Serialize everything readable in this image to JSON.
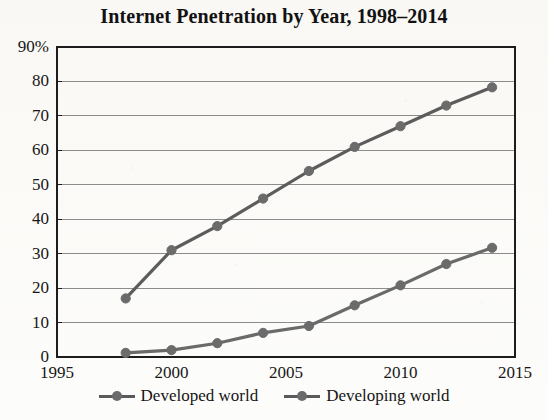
{
  "chart_data": {
    "type": "line",
    "title": "Internet Penetration by Year, 1998–2014",
    "xlabel": "",
    "ylabel": "",
    "xlim": [
      1995,
      2015
    ],
    "ylim": [
      0,
      90
    ],
    "x_ticks": [
      1995,
      2000,
      2005,
      2010,
      2015
    ],
    "x_tick_labels": [
      "1995",
      "2000",
      "2005",
      "2010",
      "2015"
    ],
    "y_ticks": [
      0,
      10,
      20,
      30,
      40,
      50,
      60,
      70,
      80,
      90
    ],
    "y_tick_labels": [
      "0",
      "10",
      "20",
      "30",
      "40",
      "50",
      "60",
      "70",
      "80",
      "90%"
    ],
    "grid": "horizontal",
    "legend_position": "bottom",
    "x": [
      1998,
      2000,
      2002,
      2004,
      2006,
      2008,
      2010,
      2012,
      2014
    ],
    "series": [
      {
        "name": "Developed world",
        "color": "#5c5c5c",
        "marker": "circle",
        "values": [
          17,
          31,
          38,
          46,
          54,
          61,
          67,
          73,
          78.3
        ]
      },
      {
        "name": "Developing world",
        "color": "#6a6a6a",
        "marker": "circle",
        "values": [
          1.2,
          2,
          4,
          7,
          9,
          15,
          20.8,
          27,
          31.7
        ]
      }
    ]
  },
  "legend": {
    "entries": [
      {
        "label": "Developed world"
      },
      {
        "label": "Developing world"
      }
    ]
  },
  "colors": {
    "line": "#5a5a5a",
    "marker": "#6b6b6b",
    "gridline": "#8c8c8c",
    "axis": "#1d1d1d",
    "text": "#141414",
    "background": "#fdfdfb"
  }
}
